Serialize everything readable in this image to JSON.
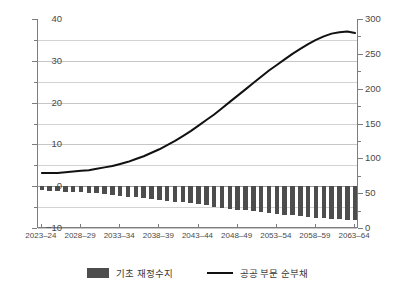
{
  "chart_data": {
    "type": "bar",
    "title": "",
    "subtitle": "",
    "xlabel": "",
    "ylabel": "",
    "grid": true,
    "legend_position": "bottom",
    "x": [
      "2023-24",
      "2024-25",
      "2025-26",
      "2026-27",
      "2027-28",
      "2028-29",
      "2029-30",
      "2030-31",
      "2031-32",
      "2032-33",
      "2033-34",
      "2034-35",
      "2035-36",
      "2036-37",
      "2037-38",
      "2038-39",
      "2039-40",
      "2040-41",
      "2041-42",
      "2042-43",
      "2043-44",
      "2044-45",
      "2045-46",
      "2046-47",
      "2047-48",
      "2048-49",
      "2049-50",
      "2050-51",
      "2051-52",
      "2052-53",
      "2053-54",
      "2054-55",
      "2055-56",
      "2056-57",
      "2057-58",
      "2058-59",
      "2059-60",
      "2060-61",
      "2061-62",
      "2062-63",
      "2063-64"
    ],
    "xtick_labels": [
      "2023-24",
      "2028-29",
      "2033-34",
      "2038-39",
      "2043-44",
      "2048-49",
      "2053-54",
      "2058-59",
      "2063-64"
    ],
    "xtick_indices": [
      0,
      5,
      10,
      15,
      20,
      25,
      30,
      35,
      40
    ],
    "axes": {
      "left": {
        "label": "",
        "min": -10,
        "max": 40,
        "major_step": 10,
        "minor_step": 5,
        "ticks": [
          -10,
          0,
          10,
          20,
          30,
          40
        ],
        "tick_labels": [
          "-10",
          "0",
          "10",
          "20",
          "30",
          "40"
        ]
      },
      "right": {
        "label": "",
        "min": 0,
        "max": 300,
        "major_step": 50,
        "minor_step": 25,
        "ticks": [
          0,
          50,
          100,
          150,
          200,
          250,
          300
        ],
        "tick_labels": [
          "0",
          "50",
          "100",
          "150",
          "200",
          "250",
          "300"
        ]
      }
    },
    "series": [
      {
        "name": "기초 재정수지",
        "type": "bar",
        "axis": "left",
        "color": "#4d4d4d",
        "values": [
          -1.0,
          -1.1,
          -1.2,
          -1.3,
          -1.4,
          -1.5,
          -1.6,
          -1.7,
          -1.9,
          -2.1,
          -2.3,
          -2.5,
          -2.7,
          -2.9,
          -3.1,
          -3.3,
          -3.5,
          -3.7,
          -3.9,
          -4.1,
          -4.3,
          -4.6,
          -4.9,
          -5.2,
          -5.4,
          -5.6,
          -5.8,
          -6.0,
          -6.2,
          -6.4,
          -6.6,
          -6.8,
          -7.0,
          -7.2,
          -7.4,
          -7.6,
          -7.7,
          -7.8,
          -7.9,
          -8.0,
          -8.1
        ]
      },
      {
        "name": "공공 부문 순부채",
        "type": "line",
        "axis": "right",
        "color": "#111111",
        "values": [
          79,
          79,
          79,
          80,
          81,
          82,
          83,
          85,
          87,
          89,
          92,
          95,
          99,
          103,
          108,
          113,
          119,
          125,
          132,
          139,
          147,
          155,
          163,
          172,
          181,
          190,
          199,
          208,
          217,
          226,
          234,
          242,
          250,
          257,
          264,
          270,
          275,
          279,
          281,
          282,
          280
        ]
      }
    ]
  },
  "legend": {
    "items": [
      {
        "label": "기초 재정수지",
        "marker": "bar-swatch"
      },
      {
        "label": "공공 부문 순부채",
        "marker": "line-swatch"
      }
    ]
  }
}
